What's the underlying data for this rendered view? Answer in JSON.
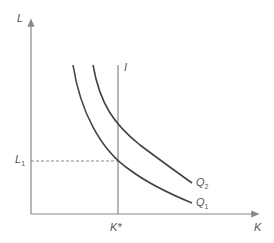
{
  "diagram": {
    "axes": {
      "y_label": "L",
      "x_label": "K"
    },
    "curves": [
      {
        "name": "Q",
        "sub": "1",
        "label": "Q1"
      },
      {
        "name": "Q",
        "sub": "2",
        "label": "Q2"
      }
    ],
    "vertical_line_label": "I",
    "k_star_label": "K*",
    "l1_label": {
      "name": "L",
      "sub": "1"
    },
    "colors": {
      "axis": "#888888",
      "curve": "#444444",
      "dashed": "#888888"
    }
  }
}
